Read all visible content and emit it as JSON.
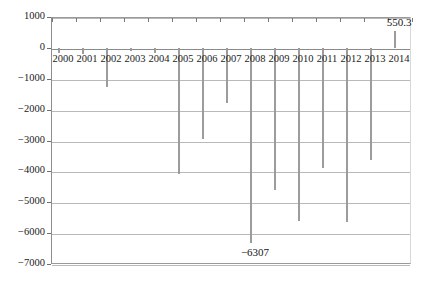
{
  "chart_data": {
    "type": "bar",
    "title": "",
    "subtitle": "",
    "xlabel": "",
    "ylabel": "",
    "categories": [
      "2000",
      "2001",
      "2002",
      "2003",
      "2004",
      "2005",
      "2006",
      "2007",
      "2008",
      "2009",
      "2010",
      "2011",
      "2012",
      "2013",
      "2014"
    ],
    "values": [
      -180,
      -200,
      -1270,
      -90,
      -175,
      -4100,
      -2950,
      -1780,
      -6307,
      -4600,
      -5620,
      -3900,
      -5650,
      -3620,
      550.3
    ],
    "series": [
      {
        "name": "",
        "values": [
          -180,
          -200,
          -1270,
          -90,
          -175,
          -4100,
          -2950,
          -1780,
          -6307,
          -4600,
          -5620,
          -3900,
          -5650,
          -3620,
          550.3
        ]
      }
    ],
    "ylim": [
      -7000,
      1000
    ],
    "ytick_values": [
      1000,
      0,
      -1000,
      -2000,
      -3000,
      -4000,
      -5000,
      -6000,
      -7000
    ],
    "ytick_labels": [
      "1000",
      "0",
      "−1000",
      "−2000",
      "−3000",
      "−4000",
      "−5000",
      "−6000",
      "−7000"
    ],
    "grid": true,
    "legend": false,
    "legend_position": "none",
    "annotations": [
      {
        "label": "550.3",
        "category": "2014",
        "value": 550.3,
        "placement": "above-bar"
      },
      {
        "label": "−6307",
        "category": "2008",
        "value": -6307,
        "placement": "below-bar"
      }
    ],
    "bar_color": "#a8a8a8",
    "gridline_color": "#b9b9b9",
    "axis_color": "#8a8a8a",
    "text_color": "#1b1b1b",
    "background_color": "#ffffff"
  }
}
